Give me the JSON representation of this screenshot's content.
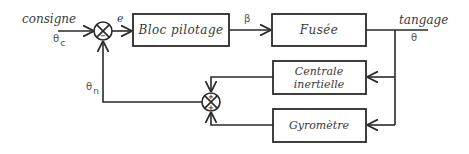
{
  "diagram": {
    "type": "block-diagram",
    "blocks": {
      "bloc_pilotage": "Bloc pilotage",
      "fusee": "Fusée",
      "centrale_line1": "Centrale",
      "centrale_line2": "inertielle",
      "gyrometre": "Gyromètre"
    },
    "signals": {
      "input_label": "consigne",
      "input_symbol": "θ",
      "input_subscript": "c",
      "error_label": "e",
      "command_label": "β",
      "output_label": "tangage",
      "output_symbol": "θ",
      "feedback_symbol": "θ",
      "feedback_subscript": "n"
    },
    "junctions": {
      "main": {
        "left_sign": "+",
        "bottom_sign": "−"
      },
      "feedback": {
        "top_sign": "+",
        "bottom_sign": "+"
      }
    }
  }
}
